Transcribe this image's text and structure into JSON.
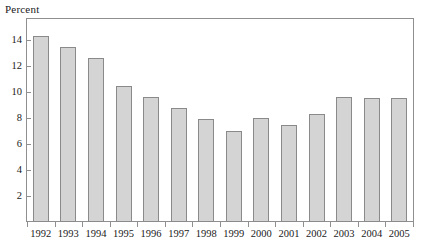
{
  "chart_data": {
    "type": "bar",
    "title": "",
    "ylabel": "Percent",
    "xlabel": "",
    "categories": [
      "1992",
      "1993",
      "1994",
      "1995",
      "1996",
      "1997",
      "1998",
      "1999",
      "2000",
      "2001",
      "2002",
      "2003",
      "2004",
      "2005"
    ],
    "values": [
      14.3,
      13.5,
      12.6,
      10.5,
      9.6,
      8.8,
      7.9,
      7.0,
      8.0,
      7.5,
      8.3,
      9.6,
      9.55,
      9.55
    ],
    "ylim": [
      0,
      15.7
    ],
    "ytick_labels": [
      "2",
      "4",
      "6",
      "8",
      "10",
      "12",
      "14"
    ],
    "ytick_values": [
      2,
      4,
      6,
      8,
      10,
      12,
      14
    ],
    "grid": false,
    "legend": null,
    "series": [
      {
        "name": "Percent",
        "values": [
          14.3,
          13.5,
          12.6,
          10.5,
          9.6,
          8.8,
          7.9,
          7.0,
          8.0,
          7.5,
          8.3,
          9.6,
          9.55,
          9.55
        ]
      }
    ]
  },
  "style": {
    "bar_fill": "#d4d4d4",
    "bar_border": "#8a8a8a",
    "frame_color": "#8f8f8f",
    "text_color": "#1a1a1a",
    "background": "#ffffff"
  }
}
